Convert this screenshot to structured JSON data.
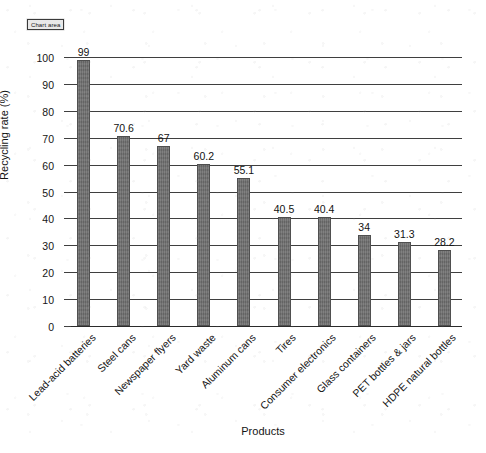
{
  "tooltip": {
    "label": "Chart area"
  },
  "chart_data": {
    "type": "bar",
    "title": "",
    "xlabel": "Products",
    "ylabel": "Recycling rate (%)",
    "ylim": [
      0,
      100
    ],
    "ytick_step": 10,
    "yticks": [
      "100",
      "90",
      "80",
      "70",
      "60",
      "50",
      "40",
      "30",
      "20",
      "10",
      "0"
    ],
    "grid": true,
    "legend": "none",
    "bar_color": "#6e6e6e",
    "categories": [
      "Lead-acid batteries",
      "Steel cans",
      "Newspaper flyers",
      "Yard waste",
      "Aluminum cans",
      "Tires",
      "Consumer electronics",
      "Glass containers",
      "PET bottles & jars",
      "HDPE natural bottles"
    ],
    "values": [
      99,
      70.6,
      67,
      60.2,
      55.1,
      40.5,
      40.4,
      34,
      31.3,
      28.2
    ],
    "value_labels": [
      "99",
      "70.6",
      "67",
      "60.2",
      "55.1",
      "40.5",
      "40.4",
      "34",
      "31.3",
      "28.2"
    ]
  }
}
